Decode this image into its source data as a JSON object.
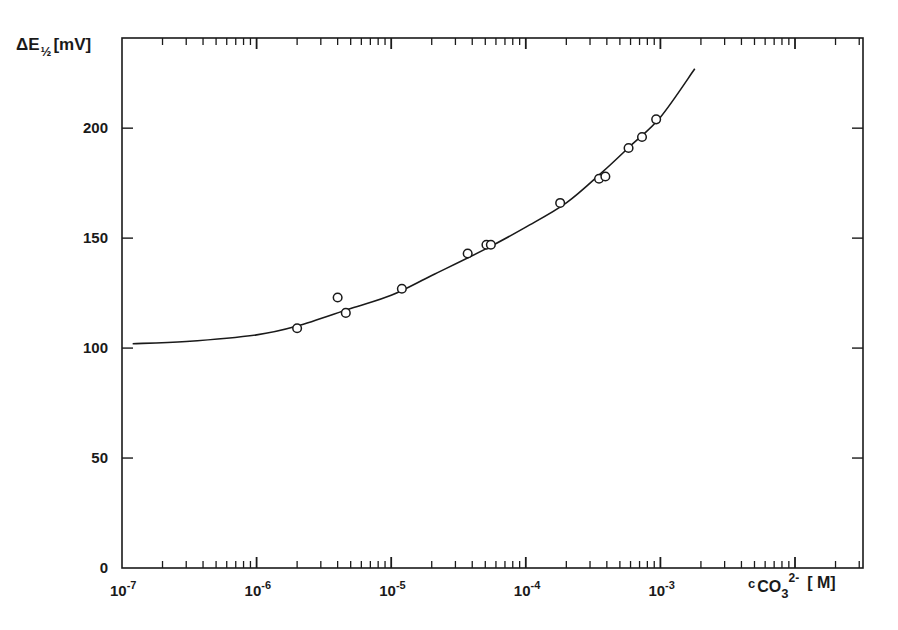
{
  "chart_data": {
    "type": "scatter",
    "title": "",
    "ylabel": "ΔE½ [mV]",
    "ylabel_parts": {
      "symbol": "ΔE",
      "subscript": "1/2",
      "unit": "[mV]"
    },
    "xlabel": "c CO3 2- [M]",
    "xlabel_parts": {
      "prefix": "c",
      "species": "CO",
      "sub": "3",
      "sup": "2-",
      "unit": "[ M]"
    },
    "xscale": "log",
    "xlim": [
      1e-07,
      0.032
    ],
    "ylim": [
      0,
      241
    ],
    "grid": false,
    "legend": null,
    "x_ticks": [
      {
        "value": 1e-07,
        "base": "10",
        "exp": "-7"
      },
      {
        "value": 1e-06,
        "base": "10",
        "exp": "-6"
      },
      {
        "value": 1e-05,
        "base": "10",
        "exp": "-5"
      },
      {
        "value": 0.0001,
        "base": "10",
        "exp": "-4"
      },
      {
        "value": 0.001,
        "base": "10",
        "exp": "-3"
      }
    ],
    "y_ticks": [
      0,
      50,
      100,
      150,
      200
    ],
    "series": [
      {
        "name": "measured",
        "kind": "scatter",
        "marker": "open-circle",
        "points": [
          {
            "x": 2e-06,
            "y": 109
          },
          {
            "x": 4e-06,
            "y": 123
          },
          {
            "x": 4.6e-06,
            "y": 116
          },
          {
            "x": 1.2e-05,
            "y": 127
          },
          {
            "x": 3.7e-05,
            "y": 143
          },
          {
            "x": 5.1e-05,
            "y": 147
          },
          {
            "x": 5.5e-05,
            "y": 147
          },
          {
            "x": 0.00018,
            "y": 166
          },
          {
            "x": 0.00035,
            "y": 177
          },
          {
            "x": 0.00039,
            "y": 178
          },
          {
            "x": 0.00058,
            "y": 191
          },
          {
            "x": 0.00073,
            "y": 196
          },
          {
            "x": 0.00093,
            "y": 204
          }
        ]
      },
      {
        "name": "fit",
        "kind": "line",
        "points": [
          {
            "x": 1.2e-07,
            "y": 102
          },
          {
            "x": 3e-07,
            "y": 103
          },
          {
            "x": 1e-06,
            "y": 106
          },
          {
            "x": 2e-06,
            "y": 110
          },
          {
            "x": 5e-06,
            "y": 118
          },
          {
            "x": 1e-05,
            "y": 124
          },
          {
            "x": 2e-05,
            "y": 133
          },
          {
            "x": 5e-05,
            "y": 145
          },
          {
            "x": 0.0001,
            "y": 155
          },
          {
            "x": 0.0002,
            "y": 166
          },
          {
            "x": 0.00037,
            "y": 180
          },
          {
            "x": 0.0006,
            "y": 192
          },
          {
            "x": 0.001,
            "y": 205
          },
          {
            "x": 0.0018,
            "y": 227
          }
        ]
      }
    ]
  },
  "colors": {
    "ink": "#1a1a1a",
    "background": "#ffffff"
  }
}
